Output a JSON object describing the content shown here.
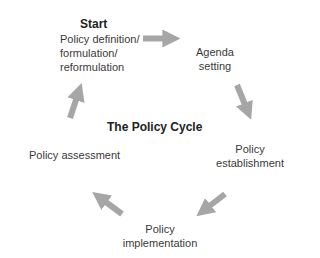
{
  "diagram": {
    "title": "The Policy Cycle",
    "start_label": "Start",
    "arrow_color": "#a6a6a6",
    "stages": [
      {
        "id": "formulation",
        "lines": [
          "Policy definition/",
          "formulation/",
          "reformulation"
        ]
      },
      {
        "id": "agenda",
        "lines": [
          "Agenda",
          "setting"
        ]
      },
      {
        "id": "establishment",
        "lines": [
          "Policy",
          "establishment"
        ]
      },
      {
        "id": "implementation",
        "lines": [
          "Policy",
          "implementation"
        ]
      },
      {
        "id": "assessment",
        "lines": [
          "Policy assessment"
        ]
      }
    ],
    "flow": [
      "formulation",
      "agenda",
      "establishment",
      "implementation",
      "assessment",
      "formulation"
    ]
  }
}
